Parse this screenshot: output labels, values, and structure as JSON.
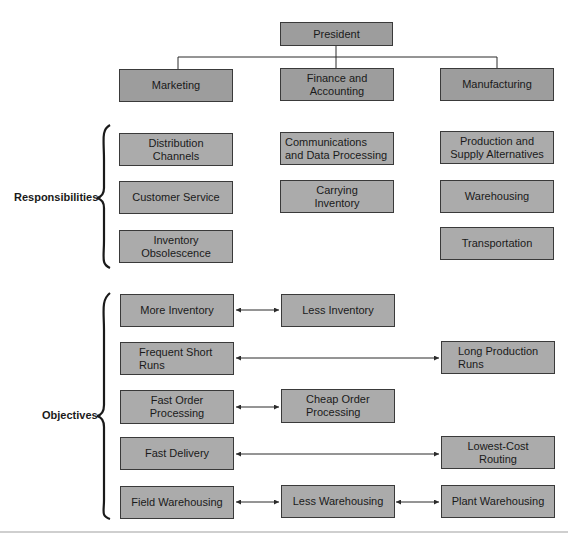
{
  "org": {
    "president": "President",
    "departments": [
      {
        "label": "Marketing"
      },
      {
        "label": "Finance and\nAccounting"
      },
      {
        "label": "Manufacturing"
      }
    ]
  },
  "responsibilities": {
    "label": "Responsibilities",
    "marketing": [
      "Distribution\nChannels",
      "Customer Service",
      "Inventory\nObsolescence"
    ],
    "finance": [
      "Communications\nand Data Processing",
      "Carrying\nInventory"
    ],
    "manufacturing": [
      "Production and\nSupply Alternatives",
      "Warehousing",
      "Transportation"
    ]
  },
  "objectives": {
    "label": "Objectives",
    "rows": [
      {
        "left": "More Inventory",
        "middle": "Less Inventory",
        "right": null
      },
      {
        "left": "Frequent Short\nRuns",
        "middle": null,
        "right": "Long Production\nRuns"
      },
      {
        "left": "Fast Order\nProcessing",
        "middle": "Cheap Order\nProcessing",
        "right": null
      },
      {
        "left": "Fast Delivery",
        "middle": null,
        "right": "Lowest-Cost\nRouting"
      },
      {
        "left": "Field Warehousing",
        "middle": "Less Warehousing",
        "right": "Plant Warehousing"
      }
    ]
  },
  "colors": {
    "box_fill": "#ababab",
    "dept_fill": "#9d9d9d",
    "border": "#3a3a3a"
  }
}
